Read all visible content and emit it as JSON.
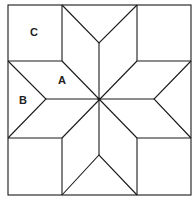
{
  "diagram": {
    "labels": [
      {
        "id": "C",
        "text": "C",
        "x": 33,
        "y": 36
      },
      {
        "id": "A",
        "text": "A",
        "x": 61,
        "y": 84
      },
      {
        "id": "B",
        "text": "B",
        "x": 23,
        "y": 104
      }
    ],
    "colors": {
      "stroke": "#1a1a1a",
      "background": "#ffffff"
    }
  }
}
